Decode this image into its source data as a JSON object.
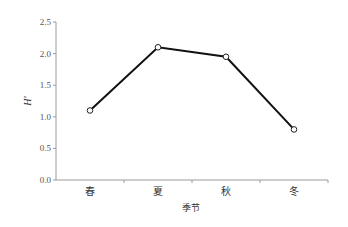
{
  "chart_data": {
    "type": "line",
    "title": "",
    "xlabel": "季节",
    "ylabel": "H′",
    "categories": [
      "春",
      "夏",
      "秋",
      "冬"
    ],
    "series": [
      {
        "name": "H′",
        "values": [
          1.1,
          2.1,
          1.95,
          0.8
        ],
        "marker": "open-circle",
        "color": "#111111"
      }
    ],
    "ylim": [
      0,
      2.5
    ],
    "yticks": [
      "0.0",
      "0.5",
      "1.0",
      "1.5",
      "2.0",
      "2.5"
    ],
    "grid": false,
    "legend": "none"
  }
}
